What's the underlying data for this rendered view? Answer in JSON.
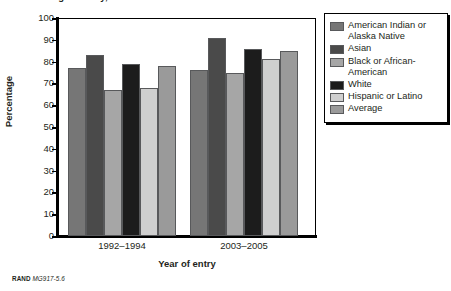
{
  "figure": {
    "title": "Percentage ... entry, ...",
    "footer_brand": "RAND",
    "footer_id": "MG917-5.6"
  },
  "chart_data": {
    "type": "bar",
    "title": "",
    "xlabel": "Year of entry",
    "ylabel": "Percentage",
    "categories": [
      "1992–1994",
      "2003–2005"
    ],
    "ylim": [
      0,
      100
    ],
    "yticks": [
      0,
      10,
      20,
      30,
      40,
      50,
      60,
      70,
      80,
      90,
      100
    ],
    "grid": false,
    "legend_position": "right",
    "series": [
      {
        "name": "American Indian or Alaska Native",
        "color": "#767676",
        "values": [
          77,
          76
        ]
      },
      {
        "name": "Asian",
        "color": "#4a4a4a",
        "values": [
          83,
          91
        ]
      },
      {
        "name": "Black or African-American",
        "color": "#a6a6a6",
        "values": [
          67,
          75
        ]
      },
      {
        "name": "White",
        "color": "#1c1c1c",
        "values": [
          79,
          86
        ]
      },
      {
        "name": "Hispanic or Latino",
        "color": "#cfcfcf",
        "values": [
          68,
          81
        ]
      },
      {
        "name": "Average",
        "color": "#9a9a9a",
        "values": [
          78,
          85
        ]
      }
    ]
  },
  "legend": {
    "items": [
      {
        "label": "American Indian or Alaska Native",
        "color": "#767676"
      },
      {
        "label": "Asian",
        "color": "#4a4a4a"
      },
      {
        "label": "Black or African-American",
        "color": "#a6a6a6"
      },
      {
        "label": "White",
        "color": "#1c1c1c"
      },
      {
        "label": "Hispanic or Latino",
        "color": "#cfcfcf"
      },
      {
        "label": "Average",
        "color": "#9a9a9a"
      }
    ]
  }
}
